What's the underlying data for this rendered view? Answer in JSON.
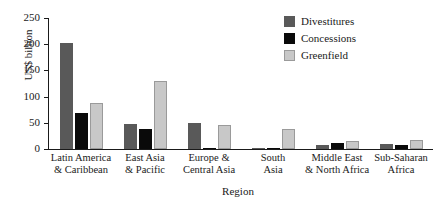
{
  "chart_data": {
    "type": "bar",
    "title": "",
    "xlabel": "Region",
    "ylabel": "US$ billion",
    "ylim": [
      0,
      250
    ],
    "yticks": [
      0,
      50,
      100,
      150,
      200,
      250
    ],
    "ytick_labels": [
      "0",
      "50",
      "100",
      "150",
      "200",
      "250"
    ],
    "grid": false,
    "legend_position": "top-right",
    "categories": [
      "Latin America\n& Caribbean",
      "East Asia\n& Pacific",
      "Europe &\nCentral Asia",
      "South\nAsia",
      "Middle East\n& North Africa",
      "Sub-Saharan\nAfrica"
    ],
    "category_lines": [
      [
        "Latin America",
        "& Caribbean"
      ],
      [
        "East Asia",
        "& Pacific"
      ],
      [
        "Europe &",
        "Central Asia"
      ],
      [
        "South",
        "Asia"
      ],
      [
        "Middle East",
        "& North Africa"
      ],
      [
        "Sub-Saharan",
        "Africa"
      ]
    ],
    "series": [
      {
        "name": "Divestitures",
        "color": "#595959",
        "values": [
          203,
          47,
          50,
          1,
          7,
          10
        ]
      },
      {
        "name": "Concessions",
        "color": "#0a0a0a",
        "values": [
          68,
          38,
          2,
          1,
          12,
          8
        ]
      },
      {
        "name": "Greenfield",
        "color": "#c8c8c8",
        "values": [
          88,
          130,
          46,
          38,
          15,
          17
        ]
      }
    ]
  },
  "legend": {
    "items": [
      {
        "label": "Divestitures",
        "swatch": "divestitures"
      },
      {
        "label": "Concessions",
        "swatch": "concessions"
      },
      {
        "label": "Greenfield",
        "swatch": "greenfield"
      }
    ]
  }
}
